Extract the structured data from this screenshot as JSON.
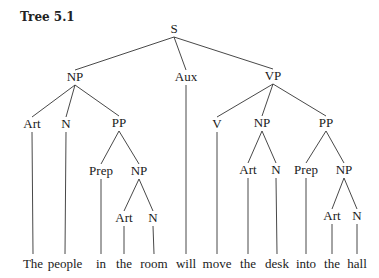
{
  "title": "Tree 5.1",
  "nodes": [
    {
      "id": "S",
      "label": "S",
      "x": 174,
      "y": 33
    },
    {
      "id": "NP1",
      "label": "NP",
      "x": 75,
      "y": 81
    },
    {
      "id": "Aux",
      "label": "Aux",
      "x": 186,
      "y": 81
    },
    {
      "id": "VP",
      "label": "VP",
      "x": 273,
      "y": 80
    },
    {
      "id": "Art1",
      "label": "Art",
      "x": 32,
      "y": 128
    },
    {
      "id": "N1",
      "label": "N",
      "x": 66,
      "y": 128
    },
    {
      "id": "PP1",
      "label": "PP",
      "x": 119,
      "y": 127
    },
    {
      "id": "V",
      "label": "V",
      "x": 217,
      "y": 128
    },
    {
      "id": "NP3",
      "label": "NP",
      "x": 262,
      "y": 127
    },
    {
      "id": "PP2",
      "label": "PP",
      "x": 326,
      "y": 127
    },
    {
      "id": "Prep1",
      "label": "Prep",
      "x": 101,
      "y": 175
    },
    {
      "id": "NP2",
      "label": "NP",
      "x": 139,
      "y": 175
    },
    {
      "id": "Art3",
      "label": "Art",
      "x": 248,
      "y": 174
    },
    {
      "id": "N3",
      "label": "N",
      "x": 276,
      "y": 174
    },
    {
      "id": "Prep2",
      "label": "Prep",
      "x": 306,
      "y": 174
    },
    {
      "id": "NP4",
      "label": "NP",
      "x": 344,
      "y": 174
    },
    {
      "id": "Art2",
      "label": "Art",
      "x": 124,
      "y": 222
    },
    {
      "id": "N2",
      "label": "N",
      "x": 153,
      "y": 222
    },
    {
      "id": "Art4",
      "label": "Art",
      "x": 332,
      "y": 220
    },
    {
      "id": "N4",
      "label": "N",
      "x": 357,
      "y": 220
    }
  ],
  "edges": [
    [
      "S",
      "NP1"
    ],
    [
      "S",
      "Aux"
    ],
    [
      "S",
      "VP"
    ],
    [
      "NP1",
      "Art1"
    ],
    [
      "NP1",
      "N1"
    ],
    [
      "NP1",
      "PP1"
    ],
    [
      "PP1",
      "Prep1"
    ],
    [
      "PP1",
      "NP2"
    ],
    [
      "NP2",
      "Art2"
    ],
    [
      "NP2",
      "N2"
    ],
    [
      "VP",
      "V"
    ],
    [
      "VP",
      "NP3"
    ],
    [
      "VP",
      "PP2"
    ],
    [
      "NP3",
      "Art3"
    ],
    [
      "NP3",
      "N3"
    ],
    [
      "PP2",
      "Prep2"
    ],
    [
      "PP2",
      "NP4"
    ],
    [
      "NP4",
      "Art4"
    ],
    [
      "NP4",
      "N4"
    ]
  ],
  "words": [
    {
      "text": "The",
      "x": 33,
      "parent": "Art1"
    },
    {
      "text": "people",
      "x": 65,
      "parent": "N1"
    },
    {
      "text": "in",
      "x": 101,
      "parent": "Prep1"
    },
    {
      "text": "the",
      "x": 124,
      "parent": "Art2"
    },
    {
      "text": "room",
      "x": 154,
      "parent": "N2"
    },
    {
      "text": "will",
      "x": 186,
      "parent": "Aux"
    },
    {
      "text": "move",
      "x": 217,
      "parent": "V"
    },
    {
      "text": "the",
      "x": 248,
      "parent": "Art3"
    },
    {
      "text": "desk",
      "x": 277,
      "parent": "N3"
    },
    {
      "text": "into",
      "x": 306,
      "parent": "Prep2"
    },
    {
      "text": "the",
      "x": 332,
      "parent": "Art4"
    },
    {
      "text": "hall",
      "x": 357,
      "parent": "N4"
    }
  ],
  "word_baseline_y": 268,
  "leaf_line_bottom_y": 254
}
